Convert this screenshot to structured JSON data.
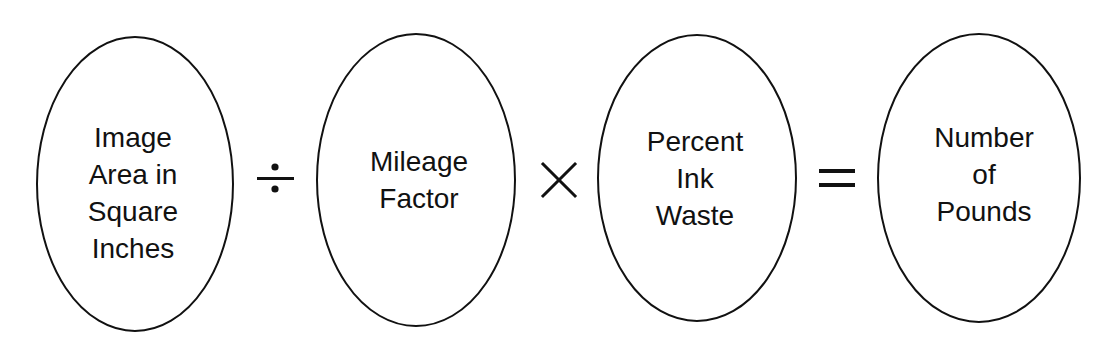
{
  "diagram": {
    "type": "formula",
    "terms": [
      {
        "id": "image-area",
        "lines": [
          "Image",
          "Area in",
          "Square",
          "Inches"
        ]
      },
      {
        "id": "mileage-factor",
        "lines": [
          "Mileage",
          "Factor"
        ]
      },
      {
        "id": "percent-ink-waste",
        "lines": [
          "Percent",
          "Ink",
          "Waste"
        ]
      },
      {
        "id": "number-of-pounds",
        "lines": [
          "Number",
          "of",
          "Pounds"
        ]
      }
    ],
    "operators": [
      {
        "id": "divide",
        "symbol": "÷"
      },
      {
        "id": "multiply",
        "symbol": "×"
      },
      {
        "id": "equals",
        "symbol": "="
      }
    ],
    "colors": {
      "stroke": "#111111",
      "background": "#ffffff"
    }
  }
}
